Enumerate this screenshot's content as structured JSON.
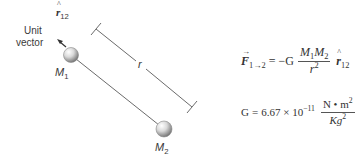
{
  "diagram": {
    "unit_vector_label_line1": "Unit",
    "unit_vector_label_line2": "vector",
    "unit_vector_symbol": "r",
    "unit_vector_hat": "^",
    "unit_vector_subscript": "12",
    "mass1_symbol": "M",
    "mass1_subscript": "1",
    "mass2_symbol": "M",
    "mass2_subscript": "2",
    "distance_label": "r",
    "colors": {
      "line": "#6b6b6b",
      "text": "#3a3a3a",
      "sphere_light": "#ffffff",
      "sphere_dark": "#6e6e6e"
    }
  },
  "equations": {
    "force": {
      "lhs_symbol": "F",
      "lhs_arrow": "→",
      "lhs_subscript": "1→2",
      "equals": "=",
      "minus_g": "−G",
      "numerator_m1": "M",
      "numerator_m1_sub": "1",
      "numerator_m2": "M",
      "numerator_m2_sub": "2",
      "denominator": "r",
      "denominator_sup": "2",
      "unit_symbol": "r",
      "unit_hat": "^",
      "unit_subscript": "12"
    },
    "gravitational_constant": {
      "lhs": "G",
      "equals": "=",
      "value": "6.67 × 10",
      "exponent": "−11",
      "unit_numerator": "N • m",
      "unit_numerator_sup": "2",
      "unit_denominator": "Kg",
      "unit_denominator_sup": "2"
    }
  }
}
